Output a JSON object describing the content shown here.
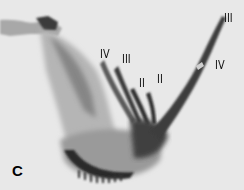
{
  "figure": {
    "panel_letter": "C",
    "labels": [
      {
        "text": "IV",
        "x": 100,
        "y": 47
      },
      {
        "text": "III",
        "x": 122,
        "y": 52
      },
      {
        "text": "II",
        "x": 139,
        "y": 76
      },
      {
        "text": "II",
        "x": 157,
        "y": 72
      },
      {
        "text": "III",
        "x": 224,
        "y": 11
      },
      {
        "text": "IV",
        "x": 215,
        "y": 58
      }
    ],
    "colors": {
      "background": "#e6e6e6",
      "tissue_light": "#c8c8c8",
      "tissue_mid": "#8a8a8a",
      "tissue_dark": "#2a2a2a"
    }
  }
}
